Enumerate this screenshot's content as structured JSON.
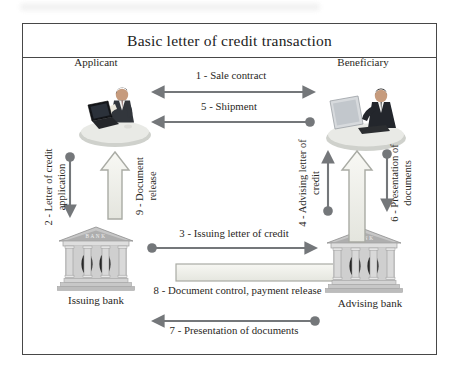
{
  "title": "Basic letter of credit transaction",
  "actors": {
    "applicant": "Applicant",
    "beneficiary": "Beneficiary",
    "issuing_bank": "Issuing bank",
    "advising_bank": "Advising bank",
    "bank_sign": "BANK"
  },
  "flows": {
    "f1": {
      "label": "1 - Sale contract",
      "from": "Applicant",
      "to": "Beneficiary",
      "direction": "bidirectional"
    },
    "f2": {
      "label": "2 - Letter of credit application",
      "from": "Applicant",
      "to": "Issuing bank",
      "direction": "down"
    },
    "f3": {
      "label": "3 - Issuing letter of credit",
      "from": "Issuing bank",
      "to": "Advising bank",
      "direction": "right"
    },
    "f4": {
      "label": "4 - Advising letter of credit",
      "from": "Advising bank",
      "to": "Beneficiary",
      "direction": "up"
    },
    "f5": {
      "label": "5 - Shipment",
      "from": "Beneficiary",
      "to": "Applicant",
      "direction": "left"
    },
    "f6": {
      "label": "6 - Presentation of documents",
      "from": "Beneficiary",
      "to": "Advising bank",
      "direction": "down"
    },
    "f7": {
      "label": "7 - Presentation of documents",
      "from": "Advising bank",
      "to": "Issuing bank",
      "direction": "left"
    },
    "f8": {
      "label": "8 - Document control, payment release",
      "from": "Advising bank",
      "to": "Issuing bank",
      "direction": "left"
    },
    "f9": {
      "label": "9 - Document release",
      "from": "Issuing bank",
      "to": "Applicant",
      "direction": "up"
    }
  },
  "colors": {
    "arrow": "#74777a",
    "frame": "#474747",
    "text": "#2a2824",
    "block_fill_light": "#f6f6f2",
    "block_fill_dark": "#e3e4dd",
    "block_stroke": "#a9aba4"
  }
}
